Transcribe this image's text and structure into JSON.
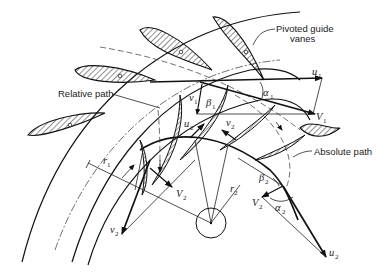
{
  "figure": {
    "type": "turbomachine velocity-triangle diagram",
    "labels": {
      "guide_vanes": "Pivoted guide vanes",
      "relative_path": "Relative path",
      "absolute_path": "Absolute path"
    },
    "symbols": {
      "u1": {
        "base": "u",
        "sub": "1"
      },
      "V1": {
        "base": "V",
        "sub": "1"
      },
      "v1": {
        "base": "v",
        "sub": "1"
      },
      "alpha1": {
        "base": "α",
        "sub": "1"
      },
      "beta1": {
        "base": "β",
        "sub": "1"
      },
      "u2_inner": {
        "base": "u",
        "sub": "2"
      },
      "v2_inner": {
        "base": "v",
        "sub": "2"
      },
      "r1": {
        "base": "r",
        "sub": "1"
      },
      "r2": {
        "base": "r",
        "sub": "2"
      },
      "V2_left": {
        "base": "V",
        "sub": "2"
      },
      "v2_left": {
        "base": "v",
        "sub": "2"
      },
      "beta2": {
        "base": "β",
        "sub": "2"
      },
      "V2_right": {
        "base": "V",
        "sub": "2"
      },
      "alpha2": {
        "base": "α",
        "sub": "2"
      },
      "u2_right": {
        "base": "u",
        "sub": "2"
      }
    },
    "colors": {
      "ink": "#111111",
      "background": "#ffffff"
    }
  }
}
